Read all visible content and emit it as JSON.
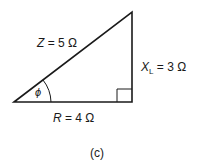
{
  "diagram": {
    "type": "impedance-triangle",
    "hypotenuse": {
      "symbol": "Z",
      "value": "= 5 Ω"
    },
    "vertical": {
      "symbol": "X",
      "subscript": "L",
      "value": "= 3 Ω"
    },
    "base": {
      "symbol": "R",
      "value": "= 4 Ω"
    },
    "angle": {
      "symbol": "ϕ"
    },
    "caption": "(c)",
    "line_color": "#1a1a1a"
  }
}
